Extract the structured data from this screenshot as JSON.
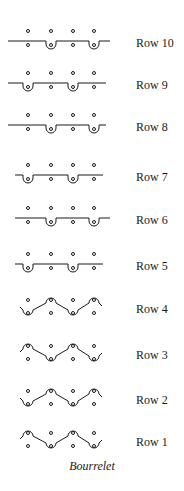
{
  "diagram": {
    "title": "Bourrelet",
    "ink_color": "#1a1a1a",
    "needle_columns_x": [
      28,
      51,
      73,
      94
    ],
    "rows": [
      {
        "label": "Row 10",
        "y": 43,
        "type": "flat",
        "loops_on": [
          1,
          3
        ],
        "line_extent": [
          8,
          110
        ]
      },
      {
        "label": "Row 9",
        "y": 85,
        "type": "flat",
        "loops_on": [
          0,
          2
        ],
        "line_extent": [
          8,
          106
        ]
      },
      {
        "label": "Row 8",
        "y": 127,
        "type": "flat",
        "loops_on": [
          1,
          3
        ],
        "line_extent": [
          8,
          106
        ]
      },
      {
        "label": "Row 7",
        "y": 177,
        "type": "flat",
        "loops_on": [
          0,
          2
        ],
        "line_extent": [
          15,
          103
        ]
      },
      {
        "label": "Row 6",
        "y": 220,
        "type": "flat",
        "loops_on": [
          1,
          3
        ],
        "line_extent": [
          15,
          110
        ]
      },
      {
        "label": "Row 5",
        "y": 266,
        "type": "flat",
        "loops_on": [
          0,
          2
        ],
        "line_extent": [
          15,
          103
        ]
      },
      {
        "label": "Row 4",
        "y": 309,
        "type": "zigzag",
        "pattern": "start-low"
      },
      {
        "label": "Row 3",
        "y": 355,
        "type": "zigzag",
        "pattern": "start-high"
      },
      {
        "label": "Row 2",
        "y": 400,
        "type": "zigzag",
        "pattern": "start-low"
      },
      {
        "label": "Row 1",
        "y": 442,
        "type": "zigzag",
        "pattern": "start-high"
      }
    ]
  }
}
